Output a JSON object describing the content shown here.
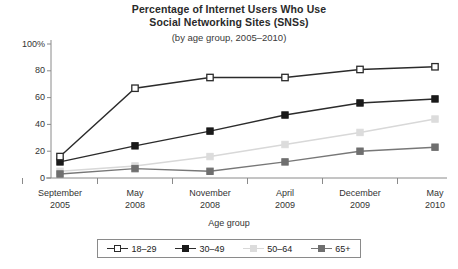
{
  "chart": {
    "title_lines": [
      "Percentage of Internet Users Who Use",
      "Social Networking Sites (SNSs)"
    ],
    "subtitle": "(by age group, 2005–2010)",
    "xlabel": "Age group"
  },
  "chart_data": {
    "type": "line",
    "title": "Percentage of Internet Users Who Use Social Networking Sites (SNSs)",
    "subtitle": "(by age group, 2005–2010)",
    "xlabel": "Age group",
    "ylabel": "",
    "ylim": [
      0,
      100
    ],
    "yticks": [
      0,
      20,
      40,
      60,
      80,
      100
    ],
    "ytick_labels": [
      "0",
      "20",
      "40",
      "60",
      "80",
      "100%"
    ],
    "grid": false,
    "legend_position": "bottom",
    "categories": [
      "September 2005",
      "May 2008",
      "November 2008",
      "April 2009",
      "December 2009",
      "May 2010"
    ],
    "category_lines": [
      [
        "September",
        "2005"
      ],
      [
        "May",
        "2008"
      ],
      [
        "November",
        "2008"
      ],
      [
        "April",
        "2009"
      ],
      [
        "December",
        "2009"
      ],
      [
        "May",
        "2010"
      ]
    ],
    "series": [
      {
        "name": "18–29",
        "color": "#2b2b2b",
        "marker": "open-square",
        "marker_fill": "#ffffff",
        "values": [
          16,
          67,
          75,
          75,
          81,
          83
        ]
      },
      {
        "name": "30–49",
        "color": "#2b2b2b",
        "marker": "filled-square",
        "marker_fill": "#1a1a1a",
        "values": [
          12,
          24,
          35,
          47,
          56,
          59
        ]
      },
      {
        "name": "50–64",
        "color": "#d8d8d8",
        "marker": "filled-square",
        "marker_fill": "#dcdcdc",
        "values": [
          5,
          9,
          16,
          25,
          34,
          44
        ]
      },
      {
        "name": "65+",
        "color": "#777777",
        "marker": "filled-square",
        "marker_fill": "#6f6f6f",
        "values": [
          3,
          7,
          5,
          12,
          20,
          23
        ]
      }
    ]
  },
  "axis_color": "#8a8a8a"
}
